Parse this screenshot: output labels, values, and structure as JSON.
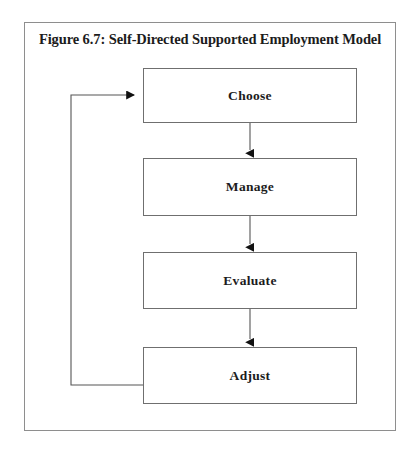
{
  "figure": {
    "title": "Figure 6.7: Self-Directed Supported Employment Model",
    "border_color": "#8e8e8e",
    "background_color": "#ffffff",
    "text_color": "#1c1c1c",
    "line_color": "#555555"
  },
  "diagram_data": {
    "type": "flowchart",
    "orientation": "vertical",
    "nodes": [
      {
        "id": "choose",
        "label": "Choose"
      },
      {
        "id": "manage",
        "label": "Manage"
      },
      {
        "id": "evaluate",
        "label": "Evaluate"
      },
      {
        "id": "adjust",
        "label": "Adjust"
      }
    ],
    "edges": [
      {
        "from": "choose",
        "to": "manage",
        "style": "straight-arrow",
        "direction": "down"
      },
      {
        "from": "manage",
        "to": "evaluate",
        "style": "straight-arrow",
        "direction": "down"
      },
      {
        "from": "evaluate",
        "to": "adjust",
        "style": "straight-arrow",
        "direction": "down"
      },
      {
        "from": "adjust",
        "to": "choose",
        "style": "feedback-loop",
        "direction": "left-up-right"
      }
    ]
  }
}
